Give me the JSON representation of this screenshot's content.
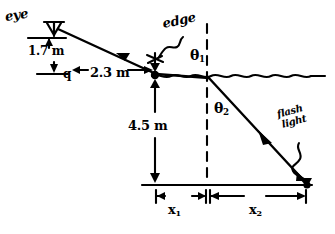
{
  "figure": {
    "ink_color": "#000000",
    "background_color": "#ffffff"
  },
  "labels": {
    "eye": "eye",
    "eye_height": "1.7 m",
    "point_q": "q",
    "horizontal_distance": "2.3 m",
    "water_depth": "4.5 m",
    "edge": "edge",
    "theta1": "θ1",
    "theta1_symbol": "θ",
    "theta1_sub": "1",
    "theta2_symbol": "θ",
    "theta2_sub": "2",
    "flashlight_line1": "flash",
    "flashlight_line2": "light",
    "x1_symbol": "x",
    "x1_sub": "1",
    "x2_symbol": "x",
    "x2_sub": "2"
  },
  "geometry": {
    "eye_point": {
      "x": 53,
      "y": 27
    },
    "edge_point": {
      "x": 155,
      "y": 75
    },
    "surface_entry_point": {
      "x": 207,
      "y": 76
    },
    "flashlight_point": {
      "x": 307,
      "y": 185
    },
    "bottom_left_point": {
      "x": 155,
      "y": 185
    },
    "normal_x": 207,
    "surface_y": 76,
    "bottom_y": 185
  },
  "elements": {
    "incident_ray": "ray-from-surface-to-eye",
    "refracted_ray": "ray-from-surface-to-flashlight",
    "water_surface": "wavy-water-surface-line",
    "normal_line": "dashed-vertical-normal",
    "pool_bottom": "pool-bottom-line",
    "edge_pointer": "squiggly-arrow-to-edge",
    "flash_pointer": "squiggly-arrow-to-flashlight"
  }
}
